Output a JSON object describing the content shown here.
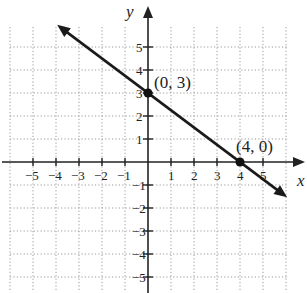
{
  "chart_data": {
    "type": "line",
    "title": "",
    "xlabel": "x",
    "ylabel": "y",
    "xlim": [
      -6,
      6
    ],
    "ylim": [
      -6,
      6
    ],
    "grid": true,
    "x_ticks": [
      -5,
      -4,
      -3,
      -2,
      -1,
      1,
      2,
      3,
      4,
      5
    ],
    "y_ticks": [
      -5,
      -4,
      -3,
      -2,
      -1,
      1,
      2,
      3,
      4,
      5
    ],
    "x_tick_labels": [
      "−5",
      "−4",
      "−3",
      "−2",
      "−1",
      "1",
      "2",
      "3",
      "4",
      "5"
    ],
    "y_tick_labels": [
      "−5",
      "−4",
      "−3",
      "−2",
      "−1",
      "1",
      "2",
      "3",
      "4",
      "5"
    ],
    "series": [
      {
        "name": "line",
        "equation": "y = -3/4 x + 3",
        "x": [
          -4,
          6
        ],
        "y": [
          6,
          -1.5
        ],
        "arrows_both_ends": true
      }
    ],
    "points": [
      {
        "x": 0,
        "y": 3,
        "label": "(0, 3)"
      },
      {
        "x": 4,
        "y": 0,
        "label": "(4, 0)"
      }
    ]
  },
  "labels": {
    "x_axis": "x",
    "y_axis": "y",
    "point_a": "(0, 3)",
    "point_b": "(4, 0)"
  },
  "colors": {
    "line": "#1a1a1a",
    "grid": "#9a9a9a",
    "background": "#ffffff"
  }
}
